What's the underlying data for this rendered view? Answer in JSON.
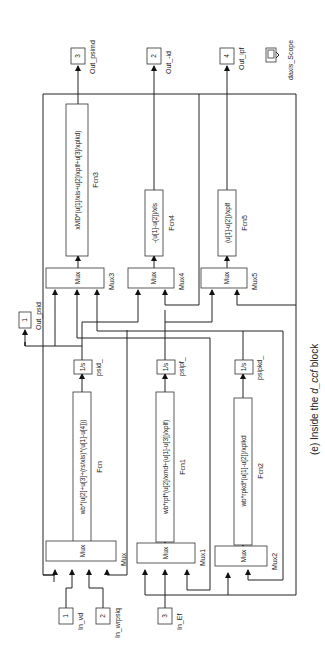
{
  "caption": {
    "prefix": "(e) Inside the ",
    "italic": "d_ccf",
    "suffix": " block"
  },
  "inports": [
    {
      "number": "1",
      "name": "In_vd"
    },
    {
      "number": "2",
      "name": "In_wrpsiq"
    },
    {
      "number": "3",
      "name": "In_Ef"
    }
  ],
  "outports": [
    {
      "number": "1",
      "name": "Out_psid"
    },
    {
      "number": "3",
      "name": "Out_psimd"
    },
    {
      "number": "2",
      "name": "Out_-id"
    },
    {
      "number": "4",
      "name": "Out_ipf"
    }
  ],
  "scope": {
    "name": "daxis_Scope"
  },
  "mux_blocks": [
    {
      "name": "Mux",
      "label": "Mux"
    },
    {
      "name": "Mux1",
      "label": "Mux"
    },
    {
      "name": "Mux2",
      "label": "Mux"
    },
    {
      "name": "Mux3",
      "label": "Mux"
    },
    {
      "name": "Mux4",
      "label": "Mux"
    },
    {
      "name": "Mux5",
      "label": "Mux"
    }
  ],
  "fcn_blocks": [
    {
      "name": "Fcn",
      "expr": "wb*(u[2]+u[3]+(rs/xls)*(u[1]-u[4]))"
    },
    {
      "name": "Fcn1",
      "expr": "wb*rpf*(u[2]/xmd+(u[1]-u[3])/xplf)"
    },
    {
      "name": "Fcn2",
      "expr": "wb*rpkd*(u[1]-u[2])/xplkd"
    },
    {
      "name": "Fcn3",
      "expr": "xMD*(u[1]/xls+u[2]/xplf+u[3]/xplkd)"
    },
    {
      "name": "Fcn4",
      "expr": "-(u[1]-u[2])/xls"
    },
    {
      "name": "Fcn5",
      "expr": "(u[1]-u[2])/xplf"
    }
  ],
  "integrators": [
    {
      "name": "psid_",
      "label": "1/s"
    },
    {
      "name": "psipf_",
      "label": "1/s"
    },
    {
      "name": "psipkd_",
      "label": "1/s"
    }
  ]
}
